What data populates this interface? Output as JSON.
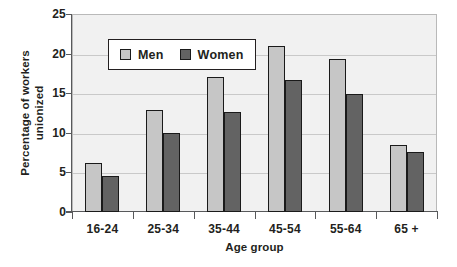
{
  "chart_data": {
    "type": "bar",
    "title": "",
    "xlabel": "Age group",
    "ylabel_line1": "Percentage of workers",
    "ylabel_line2": "unionized",
    "categories": [
      "16-24",
      "25-34",
      "35-44",
      "45-54",
      "55-64",
      "65 +"
    ],
    "series": [
      {
        "name": "Men",
        "color": "#c6c6c6",
        "values": [
          6.2,
          12.9,
          17.0,
          20.9,
          19.3,
          8.5
        ]
      },
      {
        "name": "Women",
        "color": "#636363",
        "values": [
          4.5,
          10.0,
          12.6,
          16.7,
          14.9,
          7.6
        ]
      }
    ],
    "ylim": [
      0,
      25
    ],
    "yticks": [
      0,
      5,
      10,
      15,
      20,
      25
    ],
    "ytick_labels": [
      "0",
      "5",
      "10",
      "15",
      "20",
      "25"
    ],
    "grid": true,
    "legend_position": "upper-left-inside",
    "plot_background": "#f1f1f1",
    "border_color": "#b9b9b9"
  }
}
